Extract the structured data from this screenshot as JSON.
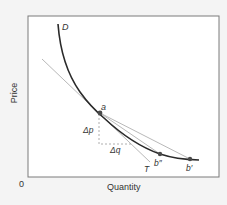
{
  "diagram": {
    "axes": {
      "x_label": "Quantity",
      "y_label": "Price",
      "origin_label": "0"
    },
    "curves": {
      "demand_label": "D",
      "tangent_label": "T"
    },
    "points": {
      "a_label": "a",
      "b_double_prime_label": "b″",
      "b_prime_label": "b′"
    },
    "deltas": {
      "delta_p_label": "Δp",
      "delta_q_label": "Δq"
    },
    "colors": {
      "background": "#f4f4f4",
      "plot_area": "#ffffff",
      "frame": "#7a7a7a",
      "demand_curve": "#2a2a2a",
      "tangent_lines": "#b0b0b0",
      "dashed_guides": "#999999",
      "points": "#4a4a4a",
      "text": "#333333"
    }
  }
}
